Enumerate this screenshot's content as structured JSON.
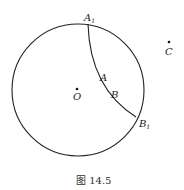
{
  "figure": {
    "caption": "图 14.5",
    "circle": {
      "cx": 78,
      "cy": 90,
      "r": 66,
      "center_label": "O"
    },
    "arc": {
      "from": "A1",
      "to": "B1"
    },
    "points": {
      "A1": {
        "label": "A",
        "sub": "1",
        "x": 88,
        "y": 24
      },
      "B1": {
        "label": "B",
        "sub": "1",
        "x": 136,
        "y": 117
      },
      "O": {
        "label": "O",
        "x": 77,
        "y": 90
      },
      "C": {
        "label": "C",
        "x": 169,
        "y": 42
      },
      "A": {
        "label": "A",
        "x": 101,
        "y": 80
      },
      "B": {
        "label": "B",
        "x": 112,
        "y": 97
      }
    }
  }
}
